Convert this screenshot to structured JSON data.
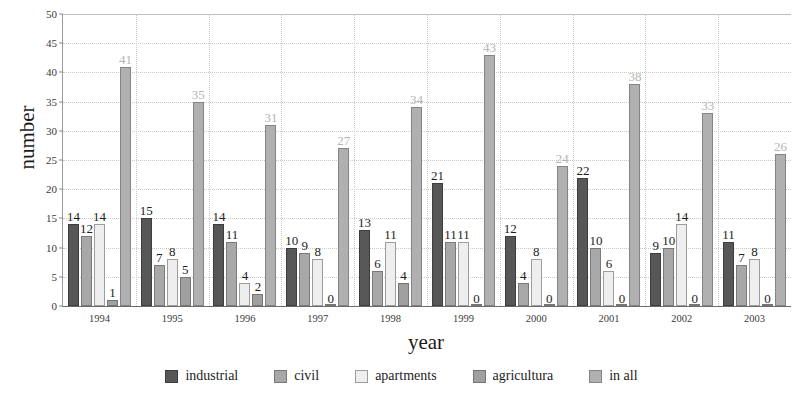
{
  "chart_data": {
    "type": "bar",
    "title": "",
    "xlabel": "year",
    "ylabel": "number",
    "ylim": [
      0,
      50
    ],
    "ytick_step": 5,
    "yticks": [
      0,
      5,
      10,
      15,
      20,
      25,
      30,
      35,
      40,
      45,
      50
    ],
    "grid": true,
    "legend_position": "bottom",
    "categories": [
      "1994",
      "1995",
      "1996",
      "1997",
      "1998",
      "1999",
      "2000",
      "2001",
      "2002",
      "2003"
    ],
    "series": [
      {
        "name": "industrial",
        "color": "#575757",
        "values": [
          14,
          15,
          14,
          10,
          13,
          21,
          12,
          22,
          9,
          11
        ]
      },
      {
        "name": "civil",
        "color": "#a8a8a8",
        "values": [
          12,
          7,
          11,
          9,
          6,
          11,
          4,
          10,
          10,
          7
        ]
      },
      {
        "name": "apartments",
        "color": "#eeeeee",
        "values": [
          14,
          8,
          4,
          8,
          11,
          11,
          8,
          6,
          14,
          8
        ]
      },
      {
        "name": "agricultura",
        "color": "#a0a0a0",
        "values": [
          1,
          5,
          2,
          0,
          4,
          0,
          0,
          0,
          0,
          0
        ]
      },
      {
        "name": "in all",
        "color": "#b0b0b0",
        "values": [
          41,
          35,
          31,
          27,
          34,
          43,
          24,
          38,
          33,
          26
        ]
      }
    ],
    "label_styles": [
      "normal",
      "normal",
      "normal",
      "normal",
      "muted"
    ]
  }
}
